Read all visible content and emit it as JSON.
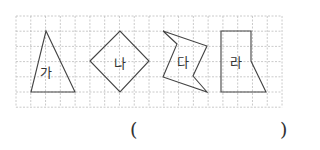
{
  "figure": {
    "grid": {
      "x0": 16,
      "y0": 16,
      "cols": 18,
      "rows": 6,
      "cell": 14.78,
      "color": "#bdbdbd"
    },
    "shapes": [
      {
        "label": "가",
        "points": "46,31 31,92 75,92",
        "label_pos": [
          46,
          72
        ]
      },
      {
        "label": "나",
        "points": "90,61 120,31 149,61 120,92",
        "label_pos": [
          120,
          63
        ]
      },
      {
        "label": "다",
        "points": "163,31 207,46 193,76 207,92 163,77 177,44",
        "label_pos": [
          183,
          62
        ]
      },
      {
        "label": "라",
        "points": "221,31 251,31 251,61 266,92 221,92",
        "label_pos": [
          236,
          62
        ]
      }
    ]
  },
  "answer": {
    "open": "(",
    "close": ")",
    "value": ""
  }
}
